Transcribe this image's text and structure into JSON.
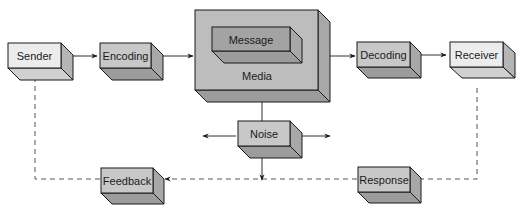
{
  "diagram": {
    "nodes": [
      {
        "id": "sender",
        "label": "Sender"
      },
      {
        "id": "encoding",
        "label": "Encoding"
      },
      {
        "id": "message",
        "label": "Message"
      },
      {
        "id": "media",
        "label": "Media"
      },
      {
        "id": "decoding",
        "label": "Decoding"
      },
      {
        "id": "receiver",
        "label": "Receiver"
      },
      {
        "id": "noise",
        "label": "Noise"
      },
      {
        "id": "response",
        "label": "Response"
      },
      {
        "id": "feedback",
        "label": "Feedback"
      }
    ],
    "edges": [
      {
        "from": "sender",
        "to": "encoding",
        "style": "solid"
      },
      {
        "from": "encoding",
        "to": "media",
        "style": "solid"
      },
      {
        "from": "media",
        "to": "decoding",
        "style": "solid"
      },
      {
        "from": "decoding",
        "to": "receiver",
        "style": "solid"
      },
      {
        "from": "noise",
        "to": "media",
        "style": "solid"
      },
      {
        "from": "noise",
        "to": "left",
        "style": "solid"
      },
      {
        "from": "noise",
        "to": "right",
        "style": "solid"
      },
      {
        "from": "noise",
        "to": "feedback-loop",
        "style": "solid"
      },
      {
        "from": "receiver",
        "to": "response",
        "style": "dashed"
      },
      {
        "from": "response",
        "to": "feedback",
        "style": "dashed"
      },
      {
        "from": "feedback",
        "to": "sender",
        "style": "dashed"
      }
    ],
    "colors": {
      "light_box": "#ececec",
      "mid_box": "#c8c8c8",
      "media_box": "#bdbdbd",
      "side_shade": "#a8a8a8",
      "bottom_shade": "#9c9c9c",
      "stroke": "#1a1a1a"
    }
  }
}
